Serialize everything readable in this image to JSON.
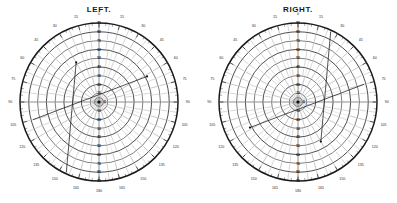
{
  "page": {
    "background": "#ffffff",
    "width": 397,
    "height": 203,
    "ink": "#1a1a1a"
  },
  "charts": [
    {
      "id": "left",
      "title": "LEFT.",
      "chart_data": {
        "type": "line",
        "plot_kind": "polar-visual-field-perimetry",
        "title": "LEFT.",
        "xlabel": "",
        "ylabel": "",
        "grid": true,
        "legend": "none",
        "angle_unit": "degrees",
        "angle_ticks": [
          0,
          15,
          30,
          45,
          60,
          75,
          90,
          105,
          120,
          135,
          150,
          165,
          180
        ],
        "angle_tick_labels_left": [
          "0",
          "15",
          "30",
          "45",
          "60",
          "75",
          "90",
          "105",
          "120",
          "135",
          "150",
          "165",
          "180"
        ],
        "angle_tick_labels_right": [
          "0",
          "15",
          "30",
          "45",
          "60",
          "75",
          "90",
          "105",
          "120",
          "135",
          "150",
          "165",
          "180"
        ],
        "radial_ticks": [
          0,
          10,
          20,
          30,
          40,
          50,
          60,
          70,
          80,
          90
        ],
        "radial_tick_labels": [
          "0",
          "10",
          "20",
          "30",
          "40",
          "50",
          "60",
          "70",
          "80",
          "90"
        ],
        "rlim": [
          0,
          90
        ],
        "center_marker": "fixation-dot",
        "series": [
          {
            "name": "isopter-90",
            "kind": "circle",
            "radius": 90,
            "values": [
              90,
              90,
              90,
              90,
              90,
              90,
              90,
              90,
              90,
              90,
              90,
              90,
              90,
              90,
              90,
              90,
              90,
              90,
              90,
              90,
              90,
              90,
              90,
              90
            ]
          },
          {
            "name": "isopter-80",
            "kind": "circle",
            "radius": 80,
            "values": [
              80,
              80,
              80,
              80,
              80,
              80,
              80,
              80,
              80,
              80,
              80,
              80,
              80,
              80,
              80,
              80,
              80,
              80,
              80,
              80,
              80,
              80,
              80,
              80
            ]
          },
          {
            "name": "isopter-70",
            "kind": "circle",
            "radius": 70,
            "values": [
              70,
              70,
              70,
              70,
              70,
              70,
              70,
              70,
              70,
              70,
              70,
              70,
              70,
              70,
              70,
              70,
              70,
              70,
              70,
              70,
              70,
              70,
              70,
              70
            ]
          },
          {
            "name": "isopter-60",
            "kind": "circle",
            "radius": 60,
            "values": [
              60,
              60,
              60,
              60,
              60,
              60,
              60,
              60,
              60,
              60,
              60,
              60,
              60,
              60,
              60,
              60,
              60,
              60,
              60,
              60,
              60,
              60,
              60,
              60
            ]
          },
          {
            "name": "isopter-50",
            "kind": "circle",
            "radius": 50,
            "values": [
              50,
              50,
              50,
              50,
              50,
              50,
              50,
              50,
              50,
              50,
              50,
              50,
              50,
              50,
              50,
              50,
              50,
              50,
              50,
              50,
              50,
              50,
              50,
              50
            ]
          },
          {
            "name": "isopter-40",
            "kind": "circle",
            "radius": 40,
            "values": [
              40,
              40,
              40,
              40,
              40,
              40,
              40,
              40,
              40,
              40,
              40,
              40,
              40,
              40,
              40,
              40,
              40,
              40,
              40,
              40,
              40,
              40,
              40,
              40
            ]
          },
          {
            "name": "isopter-30",
            "kind": "circle",
            "radius": 30,
            "values": [
              30,
              30,
              30,
              30,
              30,
              30,
              30,
              30,
              30,
              30,
              30,
              30,
              30,
              30,
              30,
              30,
              30,
              30,
              30,
              30,
              30,
              30,
              30,
              30
            ]
          },
          {
            "name": "isopter-20",
            "kind": "circle",
            "radius": 20,
            "values": [
              20,
              20,
              20,
              20,
              20,
              20,
              20,
              20,
              20,
              20,
              20,
              20,
              20,
              20,
              20,
              20,
              20,
              20,
              20,
              20,
              20,
              20,
              20,
              20
            ]
          },
          {
            "name": "isopter-10",
            "kind": "circle",
            "radius": 10,
            "values": [
              10,
              10,
              10,
              10,
              10,
              10,
              10,
              10,
              10,
              10,
              10,
              10,
              10,
              10,
              10,
              10,
              10,
              10,
              10,
              10,
              10,
              10,
              10,
              10
            ]
          },
          {
            "name": "field-trace-upper",
            "kind": "chord",
            "from_angle_deg": 255,
            "from_radius": 78,
            "to_angle_deg": 62,
            "to_radius": 62
          },
          {
            "name": "field-trace-lower",
            "kind": "chord",
            "from_angle_deg": 205,
            "from_radius": 88,
            "to_angle_deg": 330,
            "to_radius": 52
          }
        ]
      }
    },
    {
      "id": "right",
      "title": "RIGHT.",
      "chart_data": {
        "type": "line",
        "plot_kind": "polar-visual-field-perimetry",
        "title": "RIGHT.",
        "xlabel": "",
        "ylabel": "",
        "grid": true,
        "legend": "none",
        "angle_unit": "degrees",
        "angle_ticks": [
          0,
          15,
          30,
          45,
          60,
          75,
          90,
          105,
          120,
          135,
          150,
          165,
          180
        ],
        "angle_tick_labels_left": [
          "0",
          "15",
          "30",
          "45",
          "60",
          "75",
          "90",
          "105",
          "120",
          "135",
          "150",
          "165",
          "180"
        ],
        "angle_tick_labels_right": [
          "0",
          "15",
          "30",
          "45",
          "60",
          "75",
          "90",
          "105",
          "120",
          "135",
          "150",
          "165",
          "180"
        ],
        "radial_ticks": [
          0,
          10,
          20,
          30,
          40,
          50,
          60,
          70,
          80,
          90
        ],
        "radial_tick_labels": [
          "0",
          "10",
          "20",
          "30",
          "40",
          "50",
          "60",
          "70",
          "80",
          "90"
        ],
        "rlim": [
          0,
          90
        ],
        "center_marker": "fixation-dot",
        "series": [
          {
            "name": "isopter-90",
            "kind": "circle",
            "radius": 90,
            "values": [
              90,
              90,
              90,
              90,
              90,
              90,
              90,
              90,
              90,
              90,
              90,
              90,
              90,
              90,
              90,
              90,
              90,
              90,
              90,
              90,
              90,
              90,
              90,
              90
            ]
          },
          {
            "name": "isopter-80",
            "kind": "circle",
            "radius": 80,
            "values": [
              80,
              80,
              80,
              80,
              80,
              80,
              80,
              80,
              80,
              80,
              80,
              80,
              80,
              80,
              80,
              80,
              80,
              80,
              80,
              80,
              80,
              80,
              80,
              80
            ]
          },
          {
            "name": "isopter-70",
            "kind": "circle",
            "radius": 70,
            "values": [
              70,
              70,
              70,
              70,
              70,
              70,
              70,
              70,
              70,
              70,
              70,
              70,
              70,
              70,
              70,
              70,
              70,
              70,
              70,
              70,
              70,
              70,
              70,
              70
            ]
          },
          {
            "name": "isopter-60",
            "kind": "circle",
            "radius": 60,
            "values": [
              60,
              60,
              60,
              60,
              60,
              60,
              60,
              60,
              60,
              60,
              60,
              60,
              60,
              60,
              60,
              60,
              60,
              60,
              60,
              60,
              60,
              60,
              60,
              60
            ]
          },
          {
            "name": "isopter-50",
            "kind": "circle",
            "radius": 50,
            "values": [
              50,
              50,
              50,
              50,
              50,
              50,
              50,
              50,
              50,
              50,
              50,
              50,
              50,
              50,
              50,
              50,
              50,
              50,
              50,
              50,
              50,
              50,
              50,
              50
            ]
          },
          {
            "name": "isopter-40",
            "kind": "circle",
            "radius": 40,
            "values": [
              40,
              40,
              40,
              40,
              40,
              40,
              40,
              40,
              40,
              40,
              40,
              40,
              40,
              40,
              40,
              40,
              40,
              40,
              40,
              40,
              40,
              40,
              40,
              40
            ]
          },
          {
            "name": "isopter-30",
            "kind": "circle",
            "radius": 30,
            "values": [
              30,
              30,
              30,
              30,
              30,
              30,
              30,
              30,
              30,
              30,
              30,
              30,
              30,
              30,
              30,
              30,
              30,
              30,
              30,
              30,
              30,
              30,
              30,
              30
            ]
          },
          {
            "name": "isopter-20",
            "kind": "circle",
            "radius": 20,
            "values": [
              20,
              20,
              20,
              20,
              20,
              20,
              20,
              20,
              20,
              20,
              20,
              20,
              20,
              20,
              20,
              20,
              20,
              20,
              20,
              20,
              20,
              20,
              20,
              20
            ]
          },
          {
            "name": "isopter-10",
            "kind": "circle",
            "radius": 10,
            "values": [
              10,
              10,
              10,
              10,
              10,
              10,
              10,
              10,
              10,
              10,
              10,
              10,
              10,
              10,
              10,
              10,
              10,
              10,
              10,
              10,
              10,
              10,
              10,
              10
            ]
          },
          {
            "name": "field-trace-upper",
            "kind": "chord",
            "from_angle_deg": 285,
            "from_radius": 78,
            "to_angle_deg": 118,
            "to_radius": 62
          },
          {
            "name": "field-trace-lower",
            "kind": "chord",
            "from_angle_deg": 335,
            "from_radius": 88,
            "to_angle_deg": 210,
            "to_radius": 52
          }
        ]
      }
    }
  ]
}
